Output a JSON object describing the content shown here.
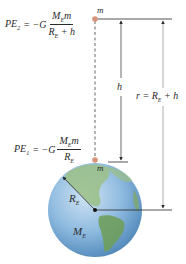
{
  "diagram": {
    "equations": {
      "pe2": {
        "lhs": "PE",
        "lhs_sub": "2",
        "eq": "= −G",
        "num_main": "M",
        "num_sub": "E",
        "num_tail": "m",
        "den_main": "R",
        "den_sub": "E",
        "den_tail": " + h"
      },
      "pe1": {
        "lhs": "PE",
        "lhs_sub": "1",
        "eq": "= −G",
        "num_main": "M",
        "num_sub": "E",
        "num_tail": "m",
        "den_main": "R",
        "den_sub": "E",
        "den_tail": ""
      }
    },
    "labels": {
      "mass_top": "m",
      "mass_bottom": "m",
      "height": "h",
      "r_main": "r = R",
      "r_sub": "E",
      "r_tail": " + h",
      "earth_radius_main": "R",
      "earth_radius_sub": "E",
      "earth_mass_main": "M",
      "earth_mass_sub": "E"
    },
    "colors": {
      "mass_dot": "#d9937a",
      "ocean": "#7fb0d6",
      "land": "#7fa76a",
      "line": "#2a2a2a",
      "arrow_gray": "#8a8a8a"
    }
  }
}
